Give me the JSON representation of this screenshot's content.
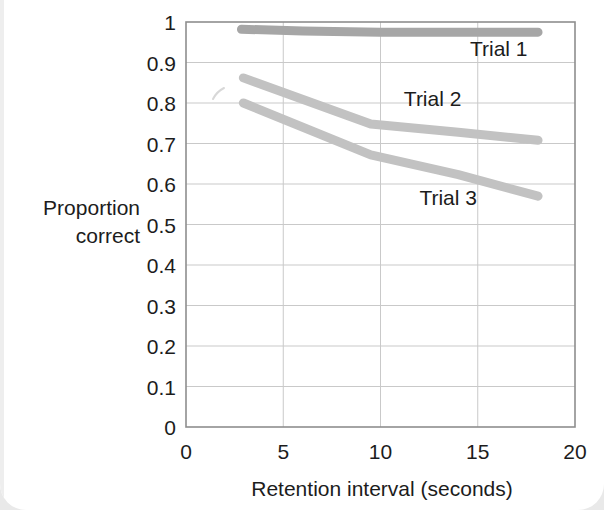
{
  "figure": {
    "background_color": "#ffffff",
    "page_color": "#e9e9e9"
  },
  "chart_data": {
    "type": "line",
    "title": "",
    "xlabel": "Retention interval (seconds)",
    "ylabel": "Proportion correct",
    "ylabel_line1": "Proportion",
    "ylabel_line2": "correct",
    "xlim": [
      0,
      20
    ],
    "ylim": [
      0,
      1
    ],
    "xticks": [
      0,
      5,
      10,
      15,
      20
    ],
    "xtick_labels": [
      "0",
      "5",
      "10",
      "15",
      "20"
    ],
    "yticks": [
      0,
      0.1,
      0.2,
      0.3,
      0.4,
      0.5,
      0.6,
      0.7,
      0.8,
      0.9,
      1
    ],
    "ytick_labels": [
      "0",
      "0.1",
      "0.2",
      "0.3",
      "0.4",
      "0.5",
      "0.6",
      "0.7",
      "0.8",
      "0.9",
      "1"
    ],
    "grid": true,
    "grid_color": "#c9c9c9",
    "legend": "inline-annotations",
    "series": [
      {
        "name": "Trial 1",
        "color": "#a6a6a6",
        "line_width": 9,
        "label_x": 14.6,
        "label_y": 0.915,
        "x": [
          2.85,
          6.0,
          10.0,
          14.0,
          18.1
        ],
        "values": [
          0.982,
          0.978,
          0.975,
          0.975,
          0.975
        ]
      },
      {
        "name": "Trial 2",
        "color": "#c2c2c2",
        "line_width": 9,
        "label_x": 11.2,
        "label_y": 0.793,
        "x": [
          2.95,
          9.5,
          14.0,
          18.1
        ],
        "values": [
          0.862,
          0.748,
          0.728,
          0.708
        ]
      },
      {
        "name": "Trial 3",
        "color": "#c2c2c2",
        "line_width": 9,
        "label_x": 12.0,
        "label_y": 0.548,
        "x": [
          2.95,
          9.5,
          14.0,
          18.1
        ],
        "values": [
          0.8,
          0.672,
          0.623,
          0.57
        ]
      }
    ],
    "annotations": [
      {
        "name": "scan-artifact",
        "x": 1.7,
        "y": 0.812
      }
    ]
  }
}
